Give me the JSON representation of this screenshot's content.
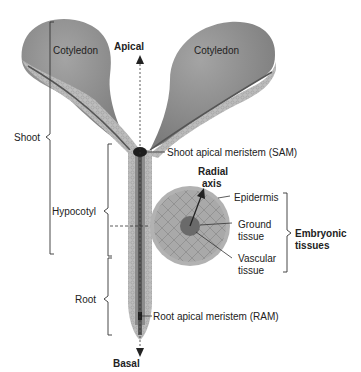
{
  "diagram": {
    "labels": {
      "cotyledon_left": "Cotyledon",
      "cotyledon_right": "Cotyledon",
      "apical": "Apical",
      "basal": "Basal",
      "shoot": "Shoot",
      "hypocotyl": "Hypocotyl",
      "root": "Root",
      "sam": "Shoot apical meristem (SAM)",
      "ram": "Root apical meristem (RAM)",
      "radial_line1": "Radial",
      "radial_line2": "axis",
      "epidermis": "Epidermis",
      "ground_line1": "Ground",
      "ground_line2": "tissue",
      "vascular_line1": "Vascular",
      "vascular_line2": "tissue",
      "embryonic_line1": "Embryonic",
      "embryonic_line2": "tissues"
    },
    "colors": {
      "cotyledon": "#8e8e8e",
      "tissue": "#b4b4b4",
      "vascular": "#5a5a5a",
      "meristem": "#1e1e1e",
      "line": "#333333"
    }
  }
}
